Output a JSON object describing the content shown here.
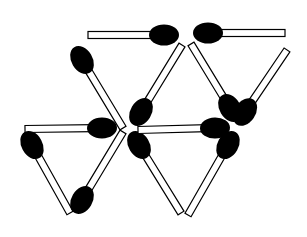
{
  "puzzle": {
    "title": "Matchstick puzzle",
    "stick_fill": "#ffffff",
    "stick_stroke": "#000000",
    "head_color": "#000000",
    "background": "#ffffff",
    "matches": [
      {
        "id": "top-left-horizontal",
        "tail": [
          88,
          35
        ],
        "head": [
          164,
          35
        ]
      },
      {
        "id": "top-right-horizontal",
        "tail": [
          285,
          33
        ],
        "head": [
          208,
          33
        ]
      },
      {
        "id": "upper-left-diagonal",
        "tail": [
          123,
          128
        ],
        "head": [
          82,
          60
        ]
      },
      {
        "id": "middle-left-horizontal",
        "tail": [
          25,
          129
        ],
        "head": [
          102,
          128
        ]
      },
      {
        "id": "left-triangle-left-side",
        "tail": [
          70,
          213
        ],
        "head": [
          32,
          145
        ]
      },
      {
        "id": "left-triangle-right-side",
        "tail": [
          123,
          132
        ],
        "head": [
          82,
          200
        ]
      },
      {
        "id": "center-diagonal-up",
        "tail": [
          182,
          45
        ],
        "head": [
          141,
          112
        ]
      },
      {
        "id": "center-diagonal-down",
        "tail": [
          181,
          213
        ],
        "head": [
          139,
          145
        ]
      },
      {
        "id": "center-horizontal",
        "tail": [
          138,
          130
        ],
        "head": [
          215,
          128
        ]
      },
      {
        "id": "right-diagonal-down",
        "tail": [
          191,
          44
        ],
        "head": [
          230,
          108
        ]
      },
      {
        "id": "right-diagonal-up",
        "tail": [
          287,
          50
        ],
        "head": [
          245,
          112
        ]
      },
      {
        "id": "right-lower-diagonal",
        "tail": [
          188,
          215
        ],
        "head": [
          228,
          145
        ]
      }
    ]
  }
}
